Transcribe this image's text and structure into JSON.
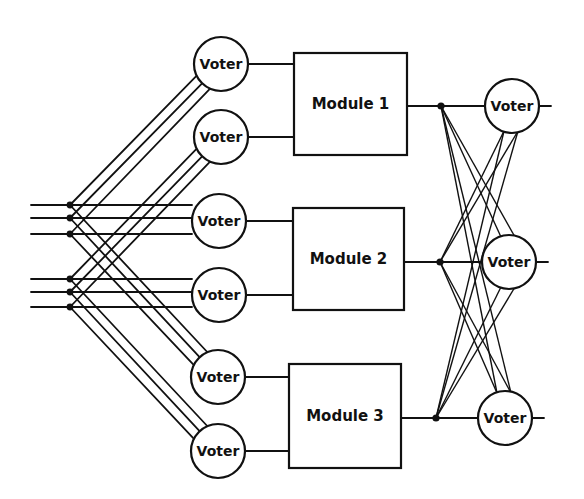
{
  "diagram": {
    "title": "",
    "colors": {
      "stroke": "#111111",
      "background": "#ffffff"
    },
    "input_voters": [
      {
        "id": "iv1",
        "label": "Voter",
        "cx": 221,
        "cy": 64
      },
      {
        "id": "iv2",
        "label": "Voter",
        "cx": 221,
        "cy": 137
      },
      {
        "id": "iv3",
        "label": "Voter",
        "cx": 219,
        "cy": 221
      },
      {
        "id": "iv4",
        "label": "Voter",
        "cx": 219,
        "cy": 295
      },
      {
        "id": "iv5",
        "label": "Voter",
        "cx": 218,
        "cy": 377
      },
      {
        "id": "iv6",
        "label": "Voter",
        "cx": 218,
        "cy": 451
      }
    ],
    "modules": [
      {
        "id": "m1",
        "label": "Module 1",
        "x": 294,
        "y": 53,
        "w": 113,
        "h": 102
      },
      {
        "id": "m2",
        "label": "Module 2",
        "x": 293,
        "y": 208,
        "w": 111,
        "h": 102
      },
      {
        "id": "m3",
        "label": "Module 3",
        "x": 289,
        "y": 364,
        "w": 112,
        "h": 104
      }
    ],
    "output_voters": [
      {
        "id": "ov1",
        "label": "Voter",
        "cx": 512,
        "cy": 106
      },
      {
        "id": "ov2",
        "label": "Voter",
        "cx": 509,
        "cy": 262
      },
      {
        "id": "ov3",
        "label": "Voter",
        "cx": 505,
        "cy": 418
      }
    ],
    "input_groups": [
      {
        "id": "g1",
        "lines_y": [
          205,
          218,
          234
        ],
        "feeds": [
          "iv1",
          "iv3",
          "iv5"
        ]
      },
      {
        "id": "g2",
        "lines_y": [
          279,
          292,
          307
        ],
        "feeds": [
          "iv2",
          "iv4",
          "iv6"
        ]
      }
    ],
    "voter_radius": 27
  }
}
